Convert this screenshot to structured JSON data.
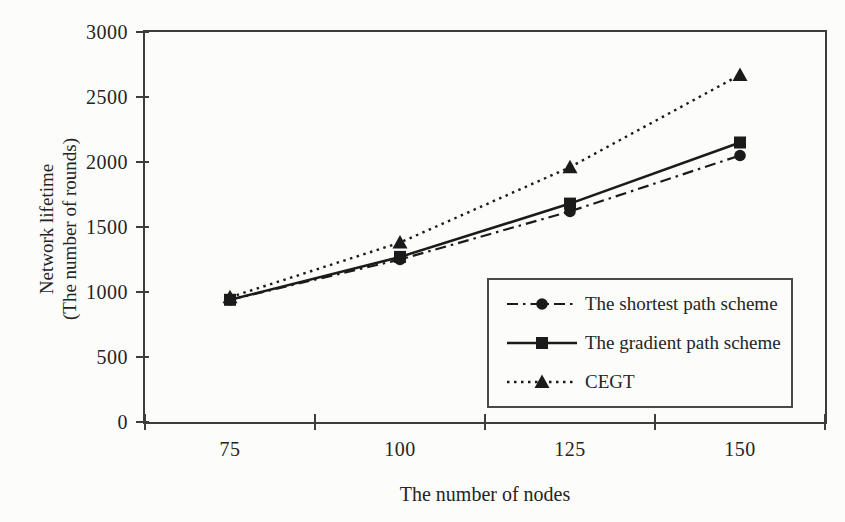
{
  "figure": {
    "background": "#fcfcfa",
    "ink": "#1b1b1b",
    "frame_color": "#3d3d3d"
  },
  "chart_data": {
    "type": "line",
    "title": "",
    "xlabel": "The number of nodes",
    "ylabel_line1": "Network lifetime",
    "ylabel_line2": "(The number of rounds)",
    "categories": [
      75,
      100,
      125,
      150
    ],
    "x_tick_labels": [
      "75",
      "100",
      "125",
      "150"
    ],
    "y_tick_labels": [
      "0",
      "500",
      "1000",
      "1500",
      "2000",
      "2500",
      "3000"
    ],
    "ylim": [
      0,
      3000
    ],
    "y_tick_step": 500,
    "grid": "off",
    "legend_position": "inside-bottom-right",
    "series": [
      {
        "id": "shortest-path",
        "name": "The shortest path scheme",
        "marker": "circle",
        "line_style": "dash-dot",
        "values": [
          940,
          1250,
          1620,
          2050
        ]
      },
      {
        "id": "gradient-path",
        "name": "The gradient path scheme",
        "marker": "square",
        "line_style": "solid",
        "values": [
          940,
          1270,
          1680,
          2150
        ]
      },
      {
        "id": "cegt",
        "name": "CEGT",
        "marker": "triangle",
        "line_style": "dotted",
        "values": [
          960,
          1380,
          1960,
          2670
        ]
      }
    ]
  }
}
